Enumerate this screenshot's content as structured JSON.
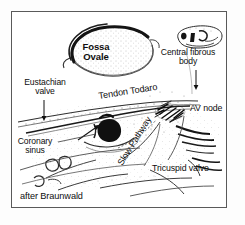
{
  "figure": {
    "kind": "anatomical-line-drawing",
    "attribution": "after Braunwald",
    "background_color": "#ffffff",
    "ink_color": "#111111",
    "frame_color": "#5a5a5a"
  },
  "labels": {
    "fossa_ovale": "Fossa\nOvale",
    "fossa_ovale_line1": "Fossa",
    "fossa_ovale_line2": "Ovale",
    "central_fibrous_body_line1": "Central fibrous",
    "central_fibrous_body_line2": "body",
    "eustachian_valve_line1": "Eustachian",
    "eustachian_valve_line2": "valve",
    "tendon_todaro": "Tendon Todaro",
    "av_node": "AV node",
    "coronary_sinus_line1": "Coronary",
    "coronary_sinus_line2": "sinus",
    "slow_pathway": "Slow Pathway",
    "tricuspid_valve": "Tricuspid valve",
    "attribution": "after Braunwald"
  },
  "annotations": {
    "eustachian_arrow": "vertical-arrow-down",
    "central_fibrous_arrow": "vertical-arrow-down",
    "coronary_sinus_leader": "horizontal-leader-line",
    "av_node_marker": "dark-hatched-cluster",
    "coronary_ostium_marker": "solid-black-blob",
    "ostium_arrow": "diagonal-arrow-up-right"
  }
}
